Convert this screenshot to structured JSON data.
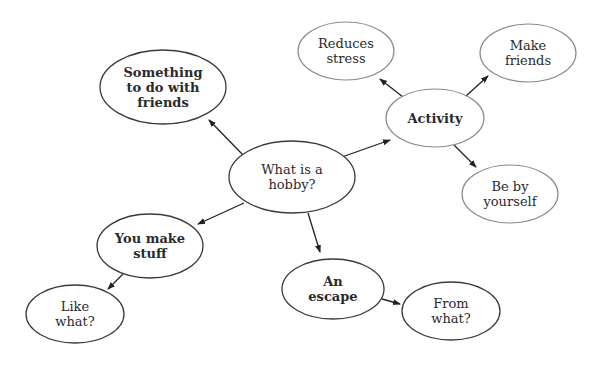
{
  "diagram": {
    "type": "concept-map",
    "nodes": [
      {
        "id": "hobby",
        "lines": [
          "What is a",
          "hobby?"
        ],
        "bold": false,
        "cx": 292,
        "cy": 177,
        "rx": 63,
        "ry": 36,
        "style": "strong"
      },
      {
        "id": "friends_activity",
        "lines": [
          "Something",
          "to do with",
          "friends"
        ],
        "bold": true,
        "cx": 163,
        "cy": 87,
        "rx": 63,
        "ry": 37,
        "style": "strong"
      },
      {
        "id": "activity",
        "lines": [
          "Activity"
        ],
        "bold": true,
        "cx": 435,
        "cy": 118,
        "rx": 49,
        "ry": 29,
        "style": "light"
      },
      {
        "id": "make_stuff",
        "lines": [
          "You make",
          "stuff"
        ],
        "bold": true,
        "cx": 150,
        "cy": 246,
        "rx": 53,
        "ry": 32,
        "style": "strong"
      },
      {
        "id": "escape",
        "lines": [
          "An",
          "escape"
        ],
        "bold": true,
        "cx": 333,
        "cy": 289,
        "rx": 51,
        "ry": 30,
        "style": "strong"
      },
      {
        "id": "reduces_stress",
        "lines": [
          "Reduces",
          "stress"
        ],
        "bold": false,
        "cx": 346,
        "cy": 51,
        "rx": 48,
        "ry": 29,
        "style": "light"
      },
      {
        "id": "make_friends",
        "lines": [
          "Make",
          "friends"
        ],
        "bold": false,
        "cx": 528,
        "cy": 53,
        "rx": 48,
        "ry": 29,
        "style": "light"
      },
      {
        "id": "be_by_yourself",
        "lines": [
          "Be by",
          "yourself"
        ],
        "bold": false,
        "cx": 510,
        "cy": 194,
        "rx": 48,
        "ry": 29,
        "style": "light"
      },
      {
        "id": "like_what",
        "lines": [
          "Like",
          "what?"
        ],
        "bold": false,
        "cx": 75,
        "cy": 314,
        "rx": 49,
        "ry": 29,
        "style": "strong"
      },
      {
        "id": "from_what",
        "lines": [
          "From",
          "what?"
        ],
        "bold": false,
        "cx": 451,
        "cy": 311,
        "rx": 49,
        "ry": 29,
        "style": "strong"
      }
    ],
    "edges": [
      {
        "from": "hobby",
        "to": "friends_activity",
        "x1": 243,
        "y1": 155,
        "x2": 209,
        "y2": 120
      },
      {
        "from": "hobby",
        "to": "activity",
        "x1": 342,
        "y1": 157,
        "x2": 390,
        "y2": 140
      },
      {
        "from": "hobby",
        "to": "make_stuff",
        "x1": 244,
        "y1": 203,
        "x2": 198,
        "y2": 224
      },
      {
        "from": "hobby",
        "to": "escape",
        "x1": 308,
        "y1": 213,
        "x2": 320,
        "y2": 252
      },
      {
        "from": "activity",
        "to": "reduces_stress",
        "x1": 403,
        "y1": 97,
        "x2": 380,
        "y2": 79
      },
      {
        "from": "activity",
        "to": "make_friends",
        "x1": 466,
        "y1": 96,
        "x2": 488,
        "y2": 76
      },
      {
        "from": "activity",
        "to": "be_by_yourself",
        "x1": 454,
        "y1": 145,
        "x2": 476,
        "y2": 167
      },
      {
        "from": "make_stuff",
        "to": "like_what",
        "x1": 123,
        "y1": 274,
        "x2": 108,
        "y2": 289
      },
      {
        "from": "escape",
        "to": "from_what",
        "x1": 382,
        "y1": 299,
        "x2": 400,
        "y2": 304
      }
    ],
    "colors": {
      "background": "#ffffff",
      "stroke_strong": "#3a3a3a",
      "stroke_light": "#8a8a8a",
      "text": "#2a2a2a",
      "arrow": "#222222"
    }
  }
}
